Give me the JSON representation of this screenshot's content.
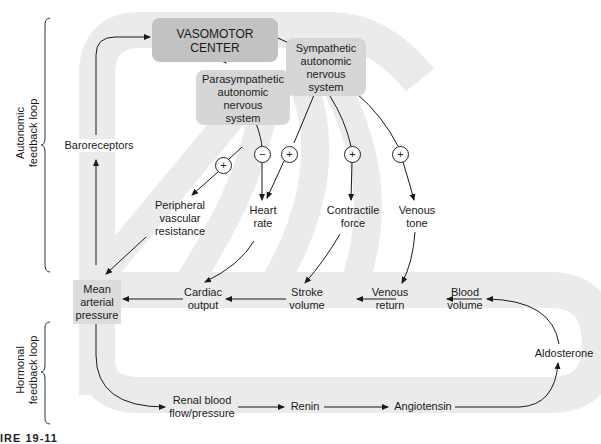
{
  "diagram": {
    "type": "feedback-loop flowchart",
    "side_labels": {
      "autonomic": "Autonomic feedback loop",
      "autonomic_lines": [
        "Autonomic",
        "feedback loop"
      ],
      "hormonal_lines": [
        "Hormonal",
        "feedback loop"
      ]
    },
    "nodes": {
      "vasomotor_center": "VASOMOTOR CENTER",
      "sympathetic": [
        "Sympathetic",
        "autonomic",
        "nervous",
        "system"
      ],
      "parasympathetic": [
        "Parasympathetic",
        "autonomic",
        "nervous",
        "system"
      ],
      "baroreceptors": "Baroreceptors",
      "peripheral_vascular_resistance": [
        "Peripheral",
        "vascular",
        "resistance"
      ],
      "heart_rate": [
        "Heart",
        "rate"
      ],
      "contractile_force": [
        "Contractile",
        "force"
      ],
      "venous_tone": [
        "Venous",
        "tone"
      ],
      "mean_arterial_pressure": [
        "Mean",
        "arterial",
        "pressure"
      ],
      "cardiac_output": [
        "Cardiac",
        "output"
      ],
      "stroke_volume": [
        "Stroke",
        "volume"
      ],
      "venous_return": [
        "Venous",
        "return"
      ],
      "blood_volume": [
        "Blood",
        "volume"
      ],
      "aldosterone": "Aldosterone",
      "renal_blood_flow": [
        "Renal blood",
        "flow/pressure"
      ],
      "renin": "Renin",
      "angiotensin": "Angiotensin"
    },
    "signs": {
      "parasym_to_heart_rate": "−",
      "sym_to_peripheral": "+",
      "sym_to_heart_rate": "+",
      "sym_to_contractile": "+",
      "sym_to_venous_tone": "+"
    },
    "edges": [
      [
        "Baroreceptors",
        "VASOMOTOR CENTER"
      ],
      [
        "VASOMOTOR CENTER",
        "Sympathetic autonomic nervous system"
      ],
      [
        "VASOMOTOR CENTER",
        "Parasympathetic autonomic nervous system"
      ],
      [
        "Parasympathetic autonomic nervous system",
        "Heart rate",
        "−"
      ],
      [
        "Sympathetic autonomic nervous system",
        "Peripheral vascular resistance",
        "+"
      ],
      [
        "Sympathetic autonomic nervous system",
        "Heart rate",
        "+"
      ],
      [
        "Sympathetic autonomic nervous system",
        "Contractile force",
        "+"
      ],
      [
        "Sympathetic autonomic nervous system",
        "Venous tone",
        "+"
      ],
      [
        "Peripheral vascular resistance",
        "Mean arterial pressure"
      ],
      [
        "Heart rate",
        "Cardiac output"
      ],
      [
        "Contractile force",
        "Stroke volume"
      ],
      [
        "Venous tone",
        "Venous return"
      ],
      [
        "Blood volume",
        "Venous return"
      ],
      [
        "Venous return",
        "Stroke volume"
      ],
      [
        "Stroke volume",
        "Cardiac output"
      ],
      [
        "Cardiac output",
        "Mean arterial pressure"
      ],
      [
        "Mean arterial pressure",
        "Baroreceptors"
      ],
      [
        "Mean arterial pressure",
        "Renal blood flow/pressure"
      ],
      [
        "Renal blood flow/pressure",
        "Renin"
      ],
      [
        "Renin",
        "Angiotensin"
      ],
      [
        "Angiotensin",
        "Aldosterone"
      ],
      [
        "Aldosterone",
        "Blood volume"
      ]
    ],
    "colors": {
      "band": "#ebebeb",
      "box_dark": "#c4c4c4",
      "box_light": "#d4d4d4",
      "line": "#1a1a1a"
    },
    "caption_fragment": "IRE 19-11"
  }
}
